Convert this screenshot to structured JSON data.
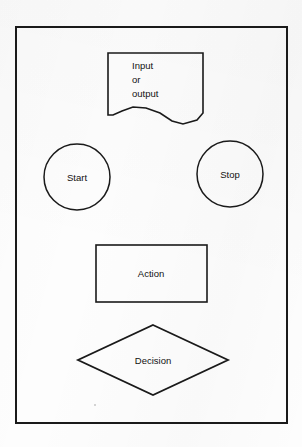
{
  "figure": {
    "background_color": "#fdfdfd",
    "stroke_color": "#1a1a1a",
    "text_color": "#111111",
    "frame": {
      "label": "diagram-border",
      "x": 16,
      "y": 27,
      "width": 271,
      "height": 396,
      "stroke_width": 2
    },
    "shapes": [
      {
        "id": "input-output",
        "kind": "document",
        "label_lines": [
          "Input",
          "or",
          "output"
        ],
        "label_align": "left",
        "x": 108,
        "y": 53,
        "width": 95,
        "height": 72,
        "stroke_width": 1.6
      },
      {
        "id": "start",
        "kind": "circle",
        "label": "Start",
        "cx": 77,
        "cy": 177,
        "r": 33,
        "stroke_width": 1.5
      },
      {
        "id": "stop",
        "kind": "circle",
        "label": "Stop",
        "cx": 230,
        "cy": 174,
        "r": 33,
        "stroke_width": 1.5
      },
      {
        "id": "action",
        "kind": "rectangle",
        "label": "Action",
        "x": 96,
        "y": 245,
        "width": 111,
        "height": 57,
        "stroke_width": 1.6
      },
      {
        "id": "decision",
        "kind": "diamond",
        "label": "Decision",
        "cx": 153,
        "cy": 360,
        "half_width": 75,
        "half_height": 35,
        "stroke_width": 1.8
      }
    ],
    "artifacts": [
      {
        "id": "scan-speck",
        "x": 95,
        "y": 405,
        "r": 1.0
      }
    ]
  }
}
